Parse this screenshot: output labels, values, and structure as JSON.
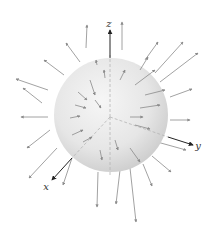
{
  "diagram": {
    "axes": [
      {
        "name": "z",
        "label": "z",
        "x1": 110,
        "y1": 117,
        "x2": 110,
        "y2": 30,
        "lx": 109,
        "ly": 27
      },
      {
        "name": "y",
        "label": "y",
        "x1": 110,
        "y1": 117,
        "x2": 193,
        "y2": 145,
        "lx": 198,
        "ly": 149
      },
      {
        "name": "x",
        "label": "x",
        "x1": 110,
        "y1": 117,
        "x2": 52,
        "y2": 180,
        "lx": 46,
        "ly": 190
      }
    ],
    "sphere": {
      "cx": 111,
      "cy": 115,
      "r": 57,
      "fill_light": "#f4f4f4",
      "fill_dark": "#cfcfcf"
    },
    "colors": {
      "arrow": "#8a8a8a",
      "axis": "#222222",
      "dash": "#b5b5b5"
    },
    "outer_arrows": [
      [
        86,
        48,
        87,
        25
      ],
      [
        80,
        62,
        66,
        43
      ],
      [
        64,
        75,
        44,
        60
      ],
      [
        48,
        90,
        16,
        79
      ],
      [
        42,
        103,
        23,
        88
      ],
      [
        48,
        117,
        21,
        117
      ],
      [
        50,
        130,
        27,
        148
      ],
      [
        57,
        148,
        29,
        178
      ],
      [
        72,
        158,
        63,
        185
      ],
      [
        98,
        172,
        97,
        207
      ],
      [
        120,
        170,
        116,
        204
      ],
      [
        130,
        168,
        136,
        222
      ],
      [
        143,
        164,
        152,
        186
      ],
      [
        152,
        156,
        171,
        172
      ],
      [
        150,
        140,
        186,
        150
      ],
      [
        170,
        120,
        190,
        120
      ],
      [
        170,
        97,
        192,
        89
      ],
      [
        160,
        82,
        198,
        53
      ],
      [
        155,
        73,
        183,
        42
      ],
      [
        145,
        60,
        158,
        42
      ],
      [
        122,
        50,
        122,
        22
      ]
    ],
    "inner_arrows": [
      [
        90,
        80,
        95,
        95
      ],
      [
        78,
        92,
        87,
        100
      ],
      [
        95,
        100,
        101,
        108
      ],
      [
        75,
        105,
        86,
        108
      ],
      [
        70,
        118,
        80,
        116
      ],
      [
        72,
        135,
        83,
        130
      ],
      [
        83,
        142,
        92,
        137
      ],
      [
        100,
        150,
        102,
        160
      ],
      [
        115,
        140,
        118,
        150
      ],
      [
        130,
        148,
        140,
        162
      ],
      [
        135,
        125,
        150,
        129
      ],
      [
        130,
        117,
        143,
        117
      ],
      [
        140,
        108,
        160,
        105
      ],
      [
        145,
        95,
        165,
        90
      ],
      [
        135,
        85,
        155,
        70
      ],
      [
        120,
        80,
        125,
        70
      ],
      [
        105,
        78,
        104,
        70
      ],
      [
        97,
        65,
        96,
        60
      ],
      [
        140,
        70,
        148,
        57
      ]
    ]
  }
}
